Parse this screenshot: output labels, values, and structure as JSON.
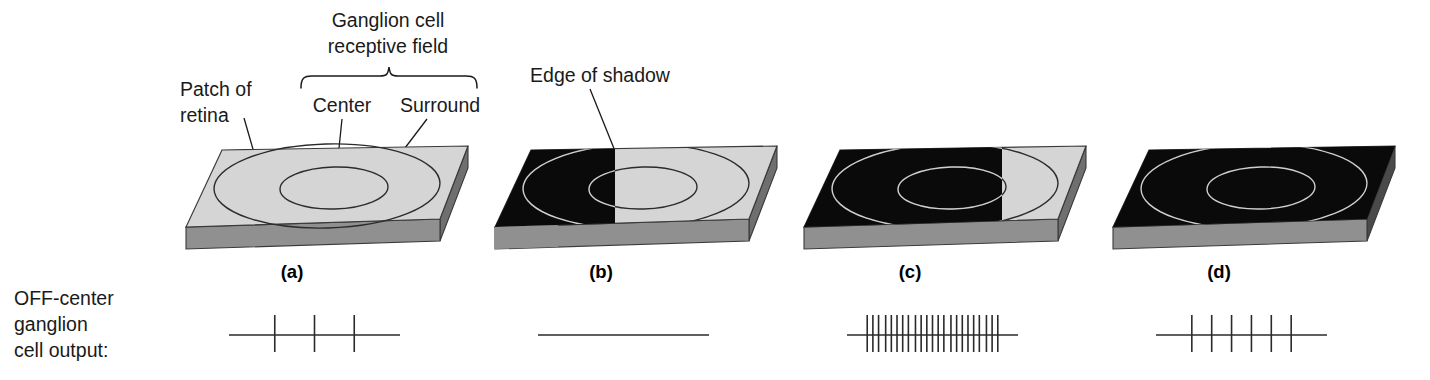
{
  "figure": {
    "title_annotations": {
      "ganglion_field_line1": "Ganglion cell",
      "ganglion_field_line2": "receptive field",
      "center": "Center",
      "surround": "Surround",
      "patch_line1": "Patch of",
      "patch_line2": "retina",
      "edge_of_shadow": "Edge of shadow"
    },
    "output_label": {
      "line1": "OFF-center",
      "line2": "ganglion",
      "line3": "cell output:"
    },
    "panels": [
      {
        "id": "a",
        "label": "(a)",
        "shadow_fraction": 0.0,
        "description": "fully illuminated patch of retina",
        "top_color": "#d5d5d5",
        "front_color": "#8f8f8f",
        "shadow_color": "#0a0a0a"
      },
      {
        "id": "b",
        "label": "(b)",
        "shadow_fraction": 0.36,
        "description": "shadow covers left part of surround only",
        "top_color": "#d5d5d5",
        "front_color": "#8f8f8f",
        "shadow_color": "#0a0a0a"
      },
      {
        "id": "c",
        "label": "(c)",
        "shadow_fraction": 0.73,
        "description": "shadow covers center and most of surround",
        "top_color": "#d5d5d5",
        "front_color": "#8f8f8f",
        "shadow_color": "#0a0a0a"
      },
      {
        "id": "d",
        "label": "(d)",
        "shadow_fraction": 1.0,
        "description": "shadow covers entire receptive field",
        "top_color": "#d5d5d5",
        "front_color": "#8f8f8f",
        "shadow_color": "#0a0a0a"
      }
    ]
  },
  "chart_data": {
    "type": "spike_raster",
    "series": [
      {
        "name": "(a)",
        "spike_count": 3,
        "spike_times": [
          0.22,
          0.5,
          0.78
        ]
      },
      {
        "name": "(b)",
        "spike_count": 0,
        "spike_times": []
      },
      {
        "name": "(c)",
        "spike_count": 23,
        "spike_times": [
          0.04,
          0.08,
          0.12,
          0.17,
          0.21,
          0.25,
          0.29,
          0.33,
          0.38,
          0.42,
          0.46,
          0.5,
          0.54,
          0.58,
          0.63,
          0.67,
          0.71,
          0.75,
          0.79,
          0.83,
          0.88,
          0.92,
          0.96
        ]
      },
      {
        "name": "(d)",
        "spike_count": 6,
        "spike_times": [
          0.15,
          0.29,
          0.43,
          0.57,
          0.71,
          0.85
        ]
      }
    ],
    "xlabel": "",
    "ylabel": "",
    "grid": false,
    "legend": "none"
  }
}
